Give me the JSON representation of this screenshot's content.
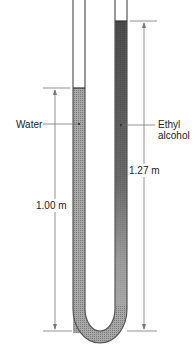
{
  "diagram": {
    "labels": {
      "water": "Water",
      "alcohol_line1": "Ethyl",
      "alcohol_line2": "alcohol",
      "water_height": "1.00 m",
      "alcohol_height": "1.27 m"
    },
    "colors": {
      "tube_wall": "#555555",
      "water_fill": "#9a9a9a",
      "alcohol_fill": "#3a3a3a",
      "dimension_line": "#777777"
    }
  }
}
